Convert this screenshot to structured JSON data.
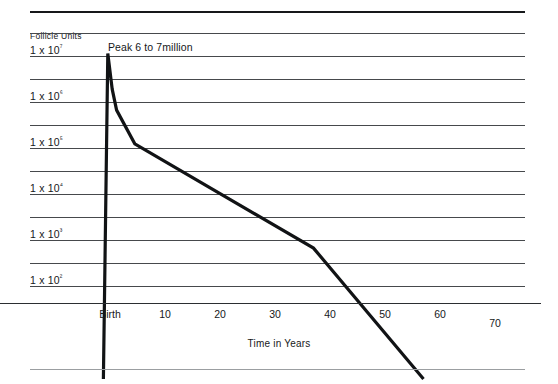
{
  "chart_data": {
    "type": "line",
    "title": "",
    "xlabel": "Time in Years",
    "ylabel": "Follicle Units",
    "xlim": [
      -8,
      70
    ],
    "ylim": [
      1,
      10000000
    ],
    "yscale": "log",
    "grid": true,
    "legend_position": "none",
    "x_tick_labels": [
      "Birth",
      "10",
      "20",
      "30",
      "40",
      "50",
      "60",
      "70"
    ],
    "x_tick_values": [
      0,
      10,
      20,
      30,
      40,
      50,
      60,
      70
    ],
    "y_tick_labels": [
      "1 x 10⁷",
      "1 x 10⁶",
      "1 x 10⁵",
      "1 x 10⁴",
      "1 x 10³",
      "1 x 10²"
    ],
    "y_tick_values": [
      10000000,
      1000000,
      100000,
      10000,
      1000,
      100
    ],
    "annotations": [
      {
        "text": "Peak 6 to 7million",
        "x": 1.5,
        "y": 9000000
      }
    ],
    "series": [
      {
        "name": "Follicle reserve",
        "color": "#111315",
        "points": [
          {
            "x": -1.2,
            "y": 1
          },
          {
            "x": -0.4,
            "y": 12000000
          },
          {
            "x": 0.4,
            "y": 2000000
          },
          {
            "x": 1.2,
            "y": 700000
          },
          {
            "x": 4.5,
            "y": 130000
          },
          {
            "x": 37.0,
            "y": 700
          },
          {
            "x": 57.0,
            "y": 1
          }
        ]
      }
    ]
  },
  "axes": {
    "y_label_text": "Follicle Units",
    "x_label_text": "Time in Years"
  },
  "colors": {
    "curve": "#111315",
    "gridline": "#46494c",
    "rule_top": "#16181a",
    "rule_bottom": "#9b9ea1",
    "text": "#16181a"
  }
}
